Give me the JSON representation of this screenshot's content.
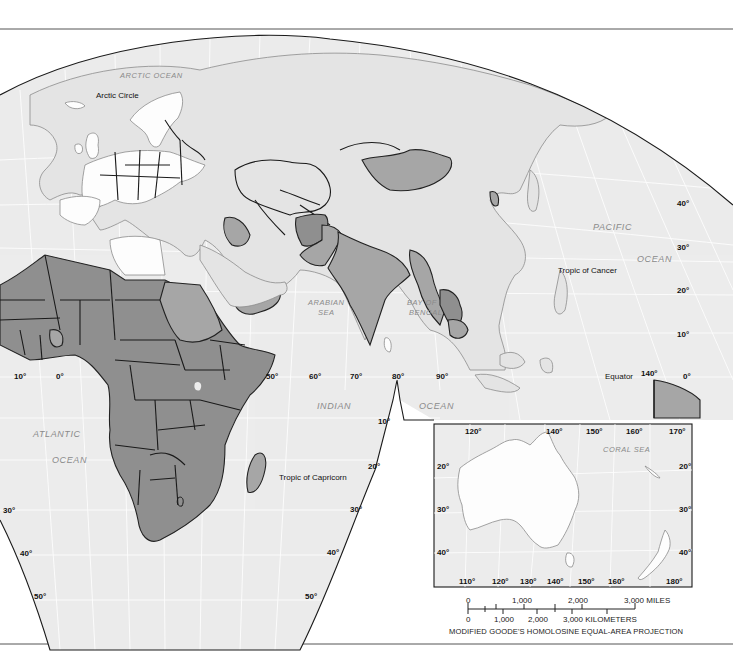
{
  "map": {
    "projection_note": "MODIFIED GOODE'S HOMOLOSINE EQUAL-AREA PROJECTION",
    "colors": {
      "ocean": "#ececec",
      "land_unshaded": "#e4e4e4",
      "land_white": "#fdfdfd",
      "land_shade_medium": "#a6a6a6",
      "land_shade_dark": "#8f8f8f",
      "ocean_label": "#8a8a8a",
      "frame": "#1a1a1a"
    },
    "reference_lines": {
      "arctic_circle": "Arctic Circle",
      "tropic_of_cancer": "Tropic of Cancer",
      "equator": "Equator",
      "tropic_of_capricorn": "Tropic of Capricorn"
    },
    "water_labels": {
      "arctic_ocean": "ARCTIC OCEAN",
      "pacific_1": "PACIFIC",
      "pacific_2": "OCEAN",
      "arabian_1": "ARABIAN",
      "arabian_2": "SEA",
      "bengal_1": "BAY OF",
      "bengal_2": "BENGAL",
      "indian_1": "INDIAN",
      "indian_2": "OCEAN",
      "atlantic_1": "ATLANTIC",
      "atlantic_2": "OCEAN",
      "coral_sea": "CORAL SEA"
    },
    "longitude_labels_main": [
      "10°",
      "0°",
      "50°",
      "60°",
      "70°",
      "80°",
      "90°",
      "140°",
      "0°"
    ],
    "latitude_labels_right": [
      "40°",
      "30°",
      "20°",
      "10°",
      "0°"
    ],
    "latitude_labels_southern_east": [
      "10°",
      "20°",
      "30°",
      "40°",
      "50°"
    ],
    "latitude_labels_southern_west": [
      "30°",
      "40°",
      "50°"
    ],
    "inset": {
      "name": "Australia and New Zealand inset",
      "top_longitudes": [
        "120°",
        "140°",
        "150°",
        "160°",
        "170°"
      ],
      "bottom_longitudes": [
        "110°",
        "120°",
        "130°",
        "140°",
        "150°",
        "160°",
        "180°"
      ],
      "left_latitudes": [
        "20°",
        "30°",
        "40°"
      ],
      "right_latitudes": [
        "20°",
        "30°",
        "40°"
      ]
    },
    "scale_bar": {
      "miles_ticks": [
        "0",
        "1,000",
        "2,000",
        "3,000 MILES"
      ],
      "km_ticks": [
        "0",
        "1,000",
        "2,000",
        "3,000 KILOMETERS"
      ]
    }
  }
}
